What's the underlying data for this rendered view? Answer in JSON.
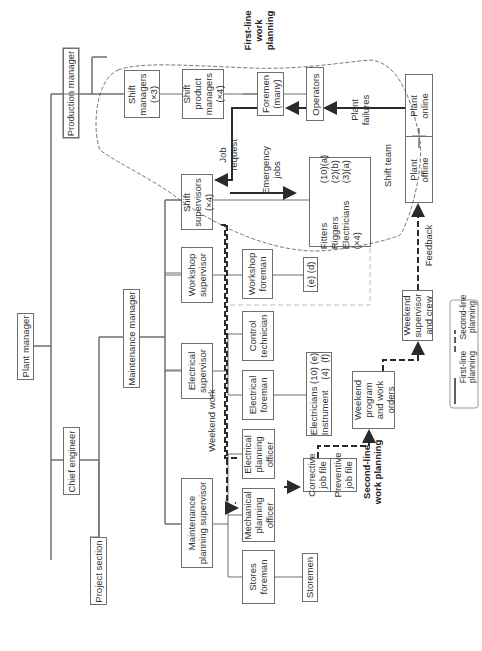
{
  "diagram": {
    "orientation": "rotated-90-ccw",
    "nodes": {
      "plant_manager": "Plant manager",
      "production_manager": "Production manager",
      "maintenance_manager": "Maintenance manager",
      "chief_engineer": "Chief engineer",
      "project_section": "Project section",
      "shift_managers": [
        "Shift",
        "managers",
        "(×3)"
      ],
      "shift_product_managers": [
        "Shift",
        "product",
        "managers",
        "(×4)"
      ],
      "foremen": [
        "Foremen",
        "(many)"
      ],
      "operators": "Operators",
      "plant_online": [
        "Plant",
        "online"
      ],
      "plant_offline": [
        "Plant",
        "offline"
      ],
      "shift_supervisors": [
        "Shift",
        "supervisors",
        "(×4)"
      ],
      "shift_crew": {
        "rows": [
          {
            "label": "Fitters",
            "count": "(10)(a)"
          },
          {
            "label": "Riggers",
            "count": "(2)(b)"
          },
          {
            "label": "Electricians",
            "count": "(3)(a)"
          },
          {
            "label": "(×4)",
            "count": ""
          }
        ]
      },
      "workshop_supervisor": [
        "Workshop",
        "supervisor"
      ],
      "workshop_foreman": [
        "Workshop",
        "foreman"
      ],
      "workshop_crew": "(e) (d)",
      "electrical_supervisor": [
        "Electrical",
        "supervisor"
      ],
      "control_technician": [
        "Control",
        "technician"
      ],
      "electrical_foreman": [
        "Electrical",
        "foreman"
      ],
      "electrical_crew": [
        "Electricians (10) (e)",
        "Instrument    (4)  (f)"
      ],
      "maintenance_planning_supervisor": [
        "Maintenance",
        "planning supervisor"
      ],
      "electrical_planning_officer": [
        "Electrical",
        "planning",
        "officer"
      ],
      "mechanical_planning_officer": [
        "Mechanical",
        "planning",
        "officer"
      ],
      "stores_foreman": [
        "Stores",
        "foreman"
      ],
      "storemen": "Storemen",
      "corrective_job_file": [
        "Corrective",
        "job file"
      ],
      "preventive_job_file": [
        "Preventive",
        "job file"
      ],
      "weekend_program": [
        "Weekend",
        "program",
        "and work",
        "orders"
      ],
      "weekend_supervisor": [
        "Weekend",
        "supervisor",
        "and crew"
      ]
    },
    "labels": {
      "first_line_work_planning": [
        "First-line",
        "work",
        "planning"
      ],
      "second_line_work_planning": [
        "Second-line",
        "work planning"
      ],
      "job_request": [
        "Job",
        "request"
      ],
      "emergency_jobs": [
        "Emergency",
        "jobs"
      ],
      "plant_failures": [
        "Plant",
        "failures"
      ],
      "shift_team": "Shift team",
      "weekend_work": "Weekend work",
      "feedback": "Feedback"
    },
    "legend": {
      "first_line": [
        "First-line",
        "planning"
      ],
      "second_line": [
        "Second-line",
        "planning"
      ]
    },
    "colors": {
      "box_stroke": "#6e6e6e",
      "arrow": "#2a2a2a",
      "text": "#333333"
    }
  }
}
